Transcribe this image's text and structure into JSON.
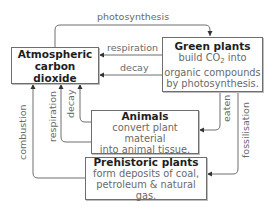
{
  "nodes": {
    "atmosphere": {
      "title_line1": "Atmospheric",
      "title_line2": "carbon dioxide"
    },
    "green_plants": {
      "title": "Green plants",
      "body_pre": "build CO",
      "body_sub": "2",
      "body_post": " into",
      "body_line2": "organic compounds",
      "body_line3": "by photosynthesis."
    },
    "animals": {
      "title": "Animals",
      "body_line1": "convert plant material",
      "body_line2": "into animal tissue."
    },
    "prehistoric": {
      "title": "Prehistoric plants",
      "body_line1": "form deposits of coal,",
      "body_line2": "petroleum & natural gas."
    }
  },
  "edges": {
    "photosynthesis": "photosynthesis",
    "plant_respiration": "respiration",
    "plant_decay": "decay",
    "animal_respiration": "respiration",
    "animal_decay": "decay",
    "eaten": "eaten",
    "fossilisation": "fossilisation",
    "combustion": "combustion"
  },
  "colors": {
    "line": "#6e6e6e",
    "title_text": "#1e1e1e",
    "body_text": "#6a6a6a"
  }
}
